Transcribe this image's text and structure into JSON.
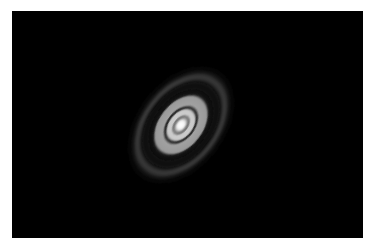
{
  "image": {
    "subject": "Protoplanetary disk with concentric bright rings and dark gaps around a central star",
    "background_color": "#000000",
    "border_color": "#ffffff",
    "frame": {
      "x": 12,
      "y": 11,
      "width": 351,
      "height": 227
    },
    "disk": {
      "center": {
        "x": 169,
        "y": 114
      },
      "rotation_deg": -52,
      "axis_ratio": 0.66,
      "rings": [
        {
          "name": "outer-halo",
          "radius": 54,
          "width": 10,
          "color": "#5a5a5a",
          "opacity": 0.45
        },
        {
          "name": "outer-glow",
          "radius": 40,
          "width": 26,
          "color": "#3a3a3a",
          "opacity": 0.5
        },
        {
          "name": "broad-ring",
          "radius": 27,
          "width": 14,
          "color": "#a8a8a8",
          "opacity": 0.85
        },
        {
          "name": "gap-2",
          "radius": 19,
          "width": 3,
          "color": "#1a1a1a",
          "opacity": 0.9
        },
        {
          "name": "inner-ring",
          "radius": 13.5,
          "width": 6,
          "color": "#c8c8c8",
          "opacity": 0.95
        },
        {
          "name": "gap-1",
          "radius": 9.5,
          "width": 2.5,
          "color": "#6a6a6a",
          "opacity": 0.9
        }
      ],
      "core": {
        "radius": 6.5,
        "color": "#ffffff"
      }
    }
  }
}
